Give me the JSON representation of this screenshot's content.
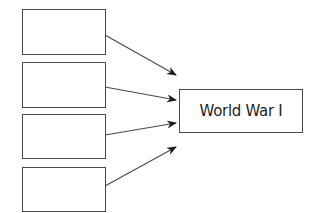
{
  "diagram": {
    "type": "cause-effect",
    "source_boxes": [
      {
        "label": "",
        "x": 22,
        "y": 9,
        "w": 83,
        "h": 45
      },
      {
        "label": "",
        "x": 22,
        "y": 62,
        "w": 83,
        "h": 45
      },
      {
        "label": "",
        "x": 22,
        "y": 114,
        "w": 83,
        "h": 44
      },
      {
        "label": "",
        "x": 22,
        "y": 167,
        "w": 83,
        "h": 45
      }
    ],
    "target_box": {
      "label": "World War I",
      "x": 179,
      "y": 89,
      "w": 123,
      "h": 43
    },
    "arrows": [
      {
        "from": 0,
        "x1": 105,
        "y1": 35,
        "x2": 176,
        "y2": 75
      },
      {
        "from": 1,
        "x1": 105,
        "y1": 87,
        "x2": 176,
        "y2": 100
      },
      {
        "from": 2,
        "x1": 105,
        "y1": 135,
        "x2": 176,
        "y2": 123
      },
      {
        "from": 3,
        "x1": 105,
        "y1": 186,
        "x2": 176,
        "y2": 147
      }
    ],
    "colors": {
      "stroke": "#4a4a4a",
      "text": "#1e1e1e",
      "background": "#ffffff"
    }
  }
}
